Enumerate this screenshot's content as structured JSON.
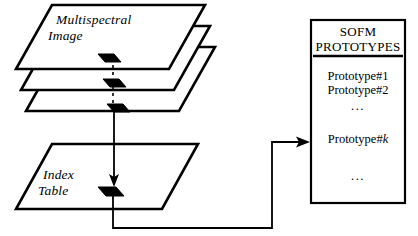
{
  "diagram": {
    "stack": {
      "label_line1": "Multispectral",
      "label_line2": "Image",
      "layer_count": 3,
      "pixel_marker_name": "selected-pixel"
    },
    "index_table": {
      "label_line1": "Index",
      "label_line2": "Table"
    },
    "panel": {
      "title_line1": "SOFM",
      "title_line2": "PROTOTYPES",
      "items": [
        {
          "text": "Prototype#",
          "suffix": "1",
          "italic_suffix": false
        },
        {
          "text": "Prototype#",
          "suffix": "2",
          "italic_suffix": false
        },
        {
          "text": "Prototype#",
          "suffix": "k",
          "italic_suffix": true
        }
      ],
      "ellipsis_mid": "...",
      "ellipsis_bottom": "..."
    },
    "colors": {
      "stroke": "#000000",
      "fill": "#ffffff",
      "marker": "#000000"
    }
  }
}
